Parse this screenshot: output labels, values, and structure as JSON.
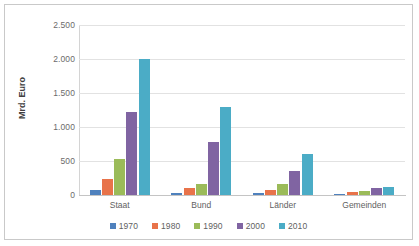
{
  "chart_data": {
    "type": "bar",
    "title": "",
    "subtitle": "",
    "xlabel": "",
    "ylabel": "Mrd. Euro",
    "ylim": [
      0,
      2500
    ],
    "ytick_labels": [
      "2.500",
      "2.000",
      "1.500",
      "1.000",
      "500",
      "0"
    ],
    "ytick_values": [
      2500,
      2000,
      1500,
      1000,
      500,
      0
    ],
    "grid": true,
    "legend_position": "bottom",
    "categories": [
      "Staat",
      "Bund",
      "Länder",
      "Gemeinden"
    ],
    "series": [
      {
        "name": "1970",
        "color": "#4F81BD",
        "values": [
          70,
          25,
          25,
          20
        ]
      },
      {
        "name": "1980",
        "color": "#E8734A",
        "values": [
          235,
          105,
          80,
          45
        ]
      },
      {
        "name": "1990",
        "color": "#9BBB59",
        "values": [
          535,
          160,
          165,
          60
        ]
      },
      {
        "name": "2000",
        "color": "#8064A2",
        "values": [
          1215,
          780,
          350,
          105
        ]
      },
      {
        "name": "2010",
        "color": "#4BACC6",
        "values": [
          2005,
          1300,
          600,
          120
        ]
      }
    ]
  }
}
